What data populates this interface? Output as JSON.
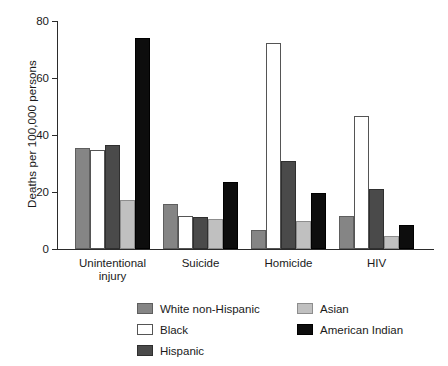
{
  "chart_data": {
    "type": "bar",
    "title": "",
    "xlabel": "",
    "ylabel": "Deaths per 100,000 persons",
    "ylim": [
      0,
      80
    ],
    "yticks": [
      0,
      20,
      40,
      60,
      80
    ],
    "ytick_labels": [
      "0",
      "20",
      "40",
      "60",
      "80"
    ],
    "grid": false,
    "legend_position": "bottom",
    "categories": [
      "Unintentional injury",
      "Suicide",
      "Homicide",
      "HIV"
    ],
    "category_labels": [
      "Unintentional\ninjury",
      "Suicide",
      "Homicide",
      "HIV"
    ],
    "series": [
      {
        "name": "White non-Hispanic",
        "color": "#858585",
        "values": [
          35.4,
          15.8,
          6.7,
          11.5
        ]
      },
      {
        "name": "Black",
        "color": "#ffffff",
        "values": [
          34.7,
          11.6,
          72.3,
          46.5
        ]
      },
      {
        "name": "Hispanic",
        "color": "#4a4a4a",
        "values": [
          36.5,
          11.2,
          30.9,
          21.0
        ]
      },
      {
        "name": "Asian",
        "color": "#c0c0c0",
        "values": [
          17.2,
          10.5,
          9.8,
          4.5
        ]
      },
      {
        "name": "American Indian",
        "color": "#0d0d0d",
        "values": [
          74.0,
          23.5,
          19.6,
          8.5
        ]
      }
    ]
  },
  "legend": {
    "column1": [
      "White non-Hispanic",
      "Black",
      "Hispanic"
    ],
    "column2": [
      "Asian",
      "American Indian"
    ]
  }
}
